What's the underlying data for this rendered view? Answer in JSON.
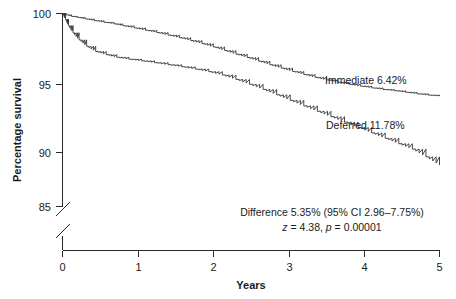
{
  "chart_data": {
    "type": "line",
    "title": "",
    "subtitle": "",
    "xlabel": "Years",
    "ylabel": "Percentage survival",
    "xlim": [
      0,
      5
    ],
    "ylim": [
      85,
      100
    ],
    "y_axis_break": true,
    "grid": false,
    "legend_position": "inline-annotation",
    "xticks": [
      "0",
      "1",
      "2",
      "3",
      "4",
      "5"
    ],
    "xtick_values": [
      0,
      1,
      2,
      3,
      4,
      5
    ],
    "yticks": [
      "85",
      "90",
      "95",
      "100"
    ],
    "ytick_values": [
      85,
      90,
      95,
      100
    ],
    "series": [
      {
        "name": "Immediate",
        "label": "Immediate 6.42%",
        "event_rate_percent": "6.42%",
        "final_survival": 93.58,
        "x": [
          0.0,
          0.05,
          0.12,
          0.2,
          0.3,
          0.42,
          0.55,
          0.68,
          0.8,
          0.95,
          1.1,
          1.25,
          1.4,
          1.55,
          1.7,
          1.85,
          2.0,
          2.15,
          2.3,
          2.45,
          2.6,
          2.75,
          2.9,
          3.05,
          3.2,
          3.35,
          3.5,
          3.65,
          3.8,
          3.95,
          4.1,
          4.25,
          4.4,
          4.55,
          4.7,
          4.85,
          5.0
        ],
        "y": [
          100.0,
          99.9,
          99.78,
          99.7,
          99.58,
          99.45,
          99.32,
          99.2,
          99.05,
          98.88,
          98.7,
          98.52,
          98.32,
          98.12,
          97.9,
          97.66,
          97.4,
          97.12,
          96.84,
          96.58,
          96.3,
          96.02,
          95.76,
          95.5,
          95.26,
          95.04,
          94.84,
          94.66,
          94.5,
          94.36,
          94.22,
          94.1,
          94.0,
          93.88,
          93.76,
          93.66,
          93.58
        ]
      },
      {
        "name": "Deferred",
        "label": "Deferred 11.78%",
        "event_rate_percent": "11.78%",
        "final_survival": 88.22,
        "x": [
          0.0,
          0.04,
          0.08,
          0.14,
          0.22,
          0.32,
          0.44,
          0.58,
          0.72,
          0.88,
          1.05,
          1.22,
          1.4,
          1.58,
          1.76,
          1.94,
          2.12,
          2.3,
          2.48,
          2.66,
          2.84,
          3.02,
          3.2,
          3.38,
          3.56,
          3.74,
          3.92,
          4.1,
          4.28,
          4.46,
          4.64,
          4.82,
          5.0
        ],
        "y": [
          100.0,
          99.55,
          99.05,
          98.5,
          97.95,
          97.45,
          97.05,
          96.8,
          96.6,
          96.45,
          96.32,
          96.18,
          96.02,
          95.86,
          95.68,
          95.48,
          95.22,
          94.88,
          94.5,
          94.1,
          93.68,
          93.25,
          92.82,
          92.4,
          91.98,
          91.56,
          91.14,
          90.72,
          90.3,
          89.88,
          89.46,
          88.86,
          88.22
        ]
      }
    ],
    "annotations": [
      {
        "name": "difference-line",
        "text": "Difference 5.35% (95% CI 2.96–7.75%)"
      },
      {
        "name": "statistics-line",
        "z_prefix": "z",
        "z_eq": " = 4.38, ",
        "p_prefix": "p",
        "p_eq": " = 0.00001"
      }
    ]
  },
  "colors": {
    "background": "#ffffff",
    "axis": "#2a2a2a",
    "curve": "#333333",
    "text": "#1a1a1a"
  }
}
